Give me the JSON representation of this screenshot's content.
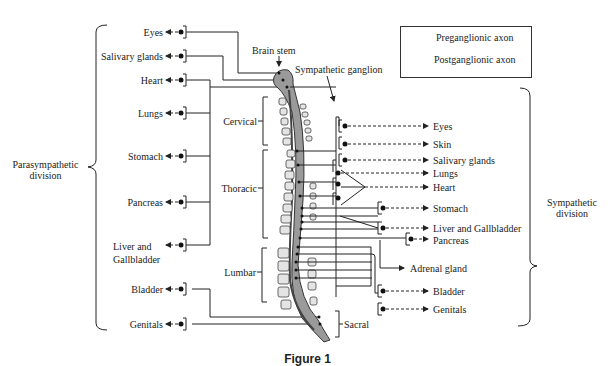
{
  "caption": "Figure 1",
  "legend": {
    "preganglionic": "Preganglionic axon",
    "postganglionic": "Postganglionic axon"
  },
  "labels": {
    "brain_stem": "Brain stem",
    "sympathetic_ganglion": "Sympathetic ganglion",
    "parasympathetic_division": [
      "Parasympathetic",
      "division"
    ],
    "sympathetic_division": [
      "Sympathetic",
      "division"
    ]
  },
  "spine_regions": [
    "Cervical",
    "Thoracic",
    "Lumbar",
    "Sacral"
  ],
  "parasympathetic_targets": [
    "Eyes",
    "Salivary glands",
    "Heart",
    "Lungs",
    "Stomach",
    "Pancreas",
    "Liver and",
    "Gallbladder",
    "Bladder",
    "Genitals"
  ],
  "sympathetic_targets": [
    "Eyes",
    "Skin",
    "Salivary glands",
    "Lungs",
    "Heart",
    "Stomach",
    "Liver and Gallbladder",
    "Pancreas",
    "Adrenal gland",
    "Bladder",
    "Genitals"
  ],
  "colors": {
    "line": "#222222",
    "cord": "#9a9a9a",
    "vertebra": "#e4e4e4"
  }
}
